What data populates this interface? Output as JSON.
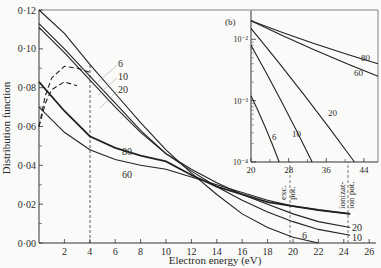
{
  "chart_data": [
    {
      "type": "line",
      "title": "",
      "xlabel": "Electron energy (eV)",
      "ylabel": "Distribution function",
      "xlim": [
        0,
        27
      ],
      "ylim": [
        0,
        0.12
      ],
      "x_ticks": [
        2,
        4,
        6,
        8,
        10,
        12,
        14,
        16,
        18,
        20,
        22,
        24,
        26
      ],
      "y_ticks": [
        "0·00",
        "0·02",
        "0·04",
        "0·06",
        "0·08",
        "0·10",
        "0·12"
      ],
      "grid": false,
      "series": [
        {
          "name": "6",
          "style": "solid",
          "x": [
            0,
            2,
            4,
            6,
            8,
            10,
            12,
            14,
            16,
            18,
            20,
            22
          ],
          "y": [
            0.12,
            0.108,
            0.092,
            0.077,
            0.062,
            0.048,
            0.036,
            0.025,
            0.015,
            0.008,
            0.003,
            0.0
          ]
        },
        {
          "name": "10",
          "style": "solid",
          "x": [
            0,
            2,
            4,
            6,
            8,
            10,
            12,
            14,
            16,
            18,
            20,
            22,
            24.5
          ],
          "y": [
            0.113,
            0.1,
            0.086,
            0.072,
            0.058,
            0.046,
            0.037,
            0.029,
            0.022,
            0.016,
            0.011,
            0.007,
            0.004
          ]
        },
        {
          "name": "20",
          "style": "solid",
          "x": [
            0,
            2,
            4,
            6,
            8,
            10,
            12,
            14,
            16,
            18,
            20,
            22,
            24.5
          ],
          "y": [
            0.111,
            0.098,
            0.084,
            0.07,
            0.057,
            0.046,
            0.038,
            0.031,
            0.025,
            0.02,
            0.015,
            0.011,
            0.008
          ]
        },
        {
          "name": "80",
          "style": "solid",
          "x": [
            0,
            2,
            4,
            6,
            8,
            10,
            12,
            14,
            16,
            18,
            20,
            22,
            24.5
          ],
          "y": [
            0.083,
            0.068,
            0.055,
            0.049,
            0.045,
            0.042,
            0.035,
            0.029,
            0.025,
            0.021,
            0.019,
            0.017,
            0.015
          ]
        },
        {
          "name": "60",
          "style": "solid",
          "x": [
            0,
            2,
            4,
            6,
            8,
            10,
            12,
            14,
            16,
            18,
            20,
            22,
            24.5
          ],
          "y": [
            0.07,
            0.057,
            0.048,
            0.043,
            0.04,
            0.038,
            0.034,
            0.03,
            0.026,
            0.022,
            0.019,
            0.017,
            0.015
          ]
        },
        {
          "name": "6 (dashed)",
          "style": "dashed",
          "x": [
            0,
            0.5,
            1,
            2,
            3,
            4
          ],
          "y": [
            0.06,
            0.076,
            0.085,
            0.091,
            0.09,
            0.088
          ]
        },
        {
          "name": "10/20 (dashed)",
          "style": "dashed",
          "x": [
            0,
            0.5,
            1,
            2,
            3
          ],
          "y": [
            0.06,
            0.072,
            0.079,
            0.083,
            0.081
          ]
        }
      ],
      "annotations": [
        {
          "text": "exc. pot.",
          "x": 19.8,
          "type": "vline-dashed"
        },
        {
          "text": "ionizat-ion pot.",
          "x": 24.3,
          "type": "vline-dashed"
        },
        {
          "text": "",
          "x": 4,
          "type": "vline-dashed"
        }
      ],
      "curve_labels": [
        "6",
        "10",
        "20",
        "80",
        "60",
        "20",
        "10",
        "6"
      ]
    },
    {
      "type": "line",
      "title": "(b)",
      "xlabel": "",
      "ylabel": "",
      "yscale": "log",
      "xlim": [
        20,
        47
      ],
      "ylim": [
        0.0001,
        0.03
      ],
      "x_ticks": [
        20,
        28,
        36,
        44
      ],
      "y_ticks": [
        "10⁻²",
        "10⁻³",
        "10⁻⁴"
      ],
      "series": [
        {
          "name": "80",
          "x": [
            20,
            47
          ],
          "y": [
            0.02,
            0.004
          ]
        },
        {
          "name": "60",
          "x": [
            20,
            47
          ],
          "y": [
            0.02,
            0.0025
          ]
        },
        {
          "name": "20",
          "x": [
            20,
            42
          ],
          "y": [
            0.015,
            0.0001
          ]
        },
        {
          "name": "10",
          "x": [
            20,
            33
          ],
          "y": [
            0.008,
            0.0001
          ]
        },
        {
          "name": "6",
          "x": [
            20,
            26
          ],
          "y": [
            0.0012,
            0.0001
          ]
        }
      ]
    }
  ],
  "labels": {
    "xlabel": "Electron energy (eV)",
    "ylabel": "Distribution function",
    "inset_tag": "(b)",
    "exc_pot": [
      "exc.",
      "pot."
    ],
    "ion_pot": [
      "ionizat-",
      "ion pot."
    ]
  }
}
